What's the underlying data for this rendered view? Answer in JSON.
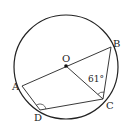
{
  "diagram": {
    "type": "circle-geometry",
    "circle": {
      "center_label": "O",
      "cx": 66,
      "cy": 67,
      "r": 52
    },
    "points": {
      "O": {
        "label": "O",
        "x": 66,
        "y": 66
      },
      "A": {
        "label": "A",
        "x": 22,
        "y": 86
      },
      "B": {
        "label": "B",
        "x": 111,
        "y": 47
      },
      "C": {
        "label": "C",
        "x": 103,
        "y": 99
      },
      "D": {
        "label": "D",
        "x": 40,
        "y": 110
      }
    },
    "segments": [
      "AB",
      "OC",
      "BC",
      "AD",
      "DC"
    ],
    "angle_marks": [
      {
        "at": "C",
        "between": [
          "O",
          "B"
        ],
        "value": "61°"
      },
      {
        "at": "D",
        "between": [
          "A",
          "C"
        ],
        "value": ""
      }
    ],
    "labels": {
      "O": "O",
      "A": "A",
      "B": "B",
      "C": "C",
      "D": "D",
      "angle_OCB": "61°"
    },
    "colors": {
      "stroke": "#222222",
      "background": "#ffffff"
    }
  }
}
